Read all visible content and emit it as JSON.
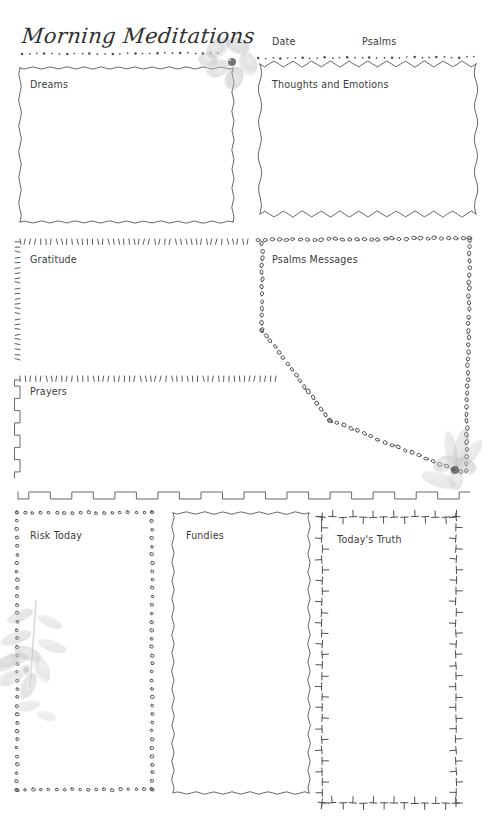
{
  "page": {
    "title": "Morning Meditations",
    "background_color": "#ffffff",
    "ink_color": "#3a3a3a",
    "width": 488,
    "height": 818
  },
  "header": {
    "title": "Morning Meditations",
    "date_label": "Date",
    "psalms_label": "Psalms"
  },
  "sections": {
    "dreams": {
      "label": "Dreams",
      "border_style": "wavy"
    },
    "thoughts": {
      "label": "Thoughts and Emotions",
      "border_style": "zigzag"
    },
    "gratitude": {
      "label": "Gratitude",
      "border_style": "tick-marks"
    },
    "psalms_messages": {
      "label": "Psalms Messages",
      "border_style": "beads"
    },
    "prayers": {
      "label": "Prayers",
      "border_style": "square-wave"
    },
    "risk_today": {
      "label": "Risk Today",
      "border_style": "square-beads"
    },
    "fundies": {
      "label": "Fundies",
      "border_style": "wavy"
    },
    "todays_truth": {
      "label": "Today's Truth",
      "border_style": "t-marks"
    }
  },
  "decorations": {
    "flower_top": "watercolor-flower",
    "flower_right": "watercolor-flower",
    "flower_bottom_left": "watercolor-flower-sprig"
  }
}
